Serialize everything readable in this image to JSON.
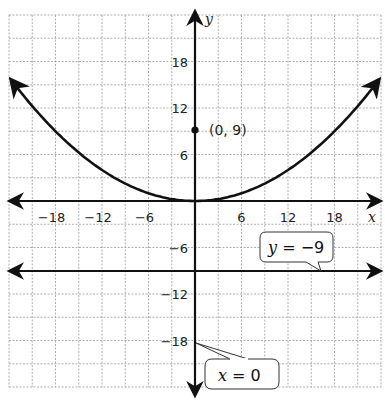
{
  "chart_data": {
    "type": "line",
    "title": "",
    "xlabel": "x",
    "ylabel": "y",
    "xlim": [
      -24,
      24
    ],
    "ylim": [
      -24,
      24
    ],
    "grid": true,
    "grid_step": 3,
    "x_ticks": [
      -18,
      -12,
      -6,
      6,
      12,
      18
    ],
    "y_ticks": [
      18,
      12,
      6,
      -6,
      -12,
      -18
    ],
    "x_tick_labels": [
      "−18",
      "−12",
      "−6",
      "6",
      "12",
      "18"
    ],
    "y_tick_labels": [
      "18",
      "12",
      "6",
      "−6",
      "−12",
      "−18"
    ],
    "series": [
      {
        "name": "parabola",
        "equation": "y = x^2/36",
        "x": [
          -24,
          -18,
          -12,
          -6,
          0,
          6,
          12,
          18,
          24
        ],
        "y": [
          16,
          9,
          4,
          1,
          0,
          1,
          4,
          9,
          16
        ]
      },
      {
        "name": "directrix",
        "label": "y = −9",
        "x": [
          -24,
          24
        ],
        "y": [
          -9,
          -9
        ]
      }
    ],
    "points": [
      {
        "x": 0,
        "y": 9,
        "label": "(0, 9)"
      }
    ],
    "annotations": [
      {
        "text_var": "y",
        "text_rest": " = −9",
        "target": "line y=-9"
      },
      {
        "text_var": "x",
        "text_rest": " = 0",
        "target": "y-axis (x=0)"
      }
    ]
  },
  "labels": {
    "x_axis": "x",
    "y_axis": "y",
    "focus_point": "(0, 9)",
    "directrix_var": "y",
    "directrix_rest": " = −9",
    "axis_var": "x",
    "axis_rest": " = 0"
  },
  "colors": {
    "curve": "#111111",
    "grid": "#9a9a9a",
    "background": "#ffffff"
  }
}
